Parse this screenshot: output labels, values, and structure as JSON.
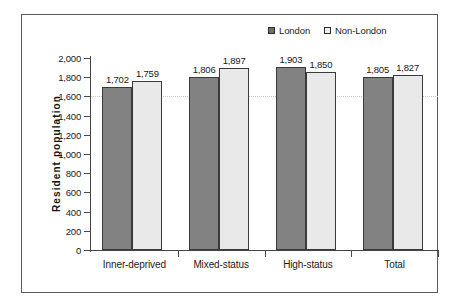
{
  "chart_data": {
    "type": "bar",
    "title": "",
    "subtitle": "",
    "xlabel": "",
    "ylabel": "Resident  population",
    "categories": [
      "Inner-deprived",
      "Mixed-status",
      "High-status",
      "Total"
    ],
    "series": [
      {
        "name": "London",
        "values": [
          1702,
          1806,
          1903,
          1805
        ],
        "color": "#828282"
      },
      {
        "name": "Non-London",
        "values": [
          1759,
          1897,
          1850,
          1827
        ],
        "color": "#e9e9e9"
      }
    ],
    "data_labels": [
      [
        "1,702",
        "1,759"
      ],
      [
        "1,806",
        "1,897"
      ],
      [
        "1,903",
        "1,850"
      ],
      [
        "1,805",
        "1,827"
      ]
    ],
    "ylim": [
      0,
      2000
    ],
    "ytick_step": 200,
    "ytick_labels": [
      "2,000",
      "1,800",
      "1,600",
      "1,400",
      "1,200",
      "1,000",
      "800",
      "600",
      "400",
      "200",
      "0"
    ],
    "ytick_values": [
      2000,
      1800,
      1600,
      1400,
      1200,
      1000,
      800,
      600,
      400,
      200,
      0
    ],
    "grid": "horizontal-faint",
    "legend_position": "top-right",
    "legend": [
      {
        "label": "London",
        "marker": "filled-square-dark"
      },
      {
        "label": "Non-London",
        "marker": "hollow-square-light"
      }
    ]
  }
}
